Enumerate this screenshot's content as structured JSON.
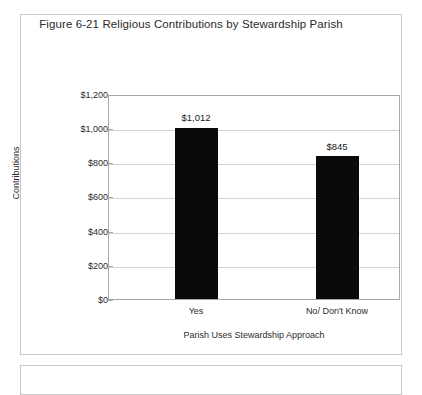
{
  "figure": {
    "border_color": "#c9c9c9"
  },
  "chart_data": {
    "type": "bar",
    "title": "Figure 6-21 Religious Contributions by Stewardship Parish",
    "categories": [
      "Yes",
      "No/ Don't Know"
    ],
    "values": [
      1012,
      845
    ],
    "data_labels": [
      "$1,012",
      "$845"
    ],
    "xlabel": "Parish Uses Stewardship Approach",
    "ylabel": "Contributions",
    "ylim": [
      0,
      1200
    ],
    "ytick_values": [
      0,
      200,
      400,
      600,
      800,
      1000,
      1200
    ],
    "ytick_labels": [
      "$0",
      "$200",
      "$400",
      "$600",
      "$800",
      "$1,000",
      "$1,200"
    ],
    "grid": true,
    "legend": false,
    "bar_color": "#0a0a0a",
    "gridline_color": "#d3d3d3",
    "axis_color": "#a8a8a8"
  }
}
